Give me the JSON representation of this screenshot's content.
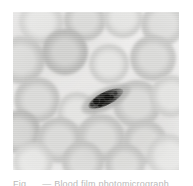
{
  "page": {
    "background_color": "#ffffff",
    "width": 193,
    "height": 186
  },
  "figure": {
    "name": "blood-smear-micrograph",
    "alt_description": "Grayscale light-microscopy image of a stained peripheral blood smear",
    "background_color": "#edeceb",
    "cell_fill_color": "#c2c2c0",
    "parasite_color": "#1e1e1c",
    "cells": [
      {
        "cx": 28,
        "cy": 10,
        "r": 22,
        "tone": "pale"
      },
      {
        "cx": 72,
        "cy": 8,
        "r": 21,
        "tone": "mid"
      },
      {
        "cx": 110,
        "cy": 6,
        "r": 20,
        "tone": "pale"
      },
      {
        "cx": 150,
        "cy": 12,
        "r": 22,
        "tone": "mid"
      },
      {
        "cx": 8,
        "cy": 48,
        "r": 24,
        "tone": "mid"
      },
      {
        "cx": 52,
        "cy": 40,
        "r": 23,
        "tone": "dark"
      },
      {
        "cx": 96,
        "cy": 52,
        "r": 20,
        "tone": "pale"
      },
      {
        "cx": 140,
        "cy": 46,
        "r": 23,
        "tone": "mid"
      },
      {
        "cx": 24,
        "cy": 88,
        "r": 23,
        "tone": "mid"
      },
      {
        "cx": 64,
        "cy": 100,
        "r": 20,
        "tone": "pale"
      },
      {
        "cx": 124,
        "cy": 92,
        "r": 24,
        "tone": "mid"
      },
      {
        "cx": 158,
        "cy": 84,
        "r": 21,
        "tone": "pale"
      },
      {
        "cx": 6,
        "cy": 120,
        "r": 22,
        "tone": "dark"
      },
      {
        "cx": 46,
        "cy": 128,
        "r": 23,
        "tone": "mid"
      },
      {
        "cx": 88,
        "cy": 126,
        "r": 24,
        "tone": "mid"
      },
      {
        "cx": 132,
        "cy": 130,
        "r": 22,
        "tone": "mid"
      },
      {
        "cx": 20,
        "cy": 150,
        "r": 20,
        "tone": "pale"
      },
      {
        "cx": 70,
        "cy": 150,
        "r": 21,
        "tone": "mid"
      },
      {
        "cx": 112,
        "cy": 152,
        "r": 20,
        "tone": "mid"
      },
      {
        "cx": 156,
        "cy": 144,
        "r": 22,
        "tone": "pale"
      }
    ],
    "parasite": {
      "name": "crescent-shaped-parasite",
      "shape": "elongated crescent (banana-shaped) form",
      "center_x": 93,
      "center_y": 87,
      "length": 54,
      "width": 18,
      "rotation_deg": -26,
      "chromatin_dots": [
        {
          "x": 14,
          "y": 12,
          "d": 6
        },
        {
          "x": 20,
          "y": 15,
          "d": 5
        },
        {
          "x": 26,
          "y": 13,
          "d": 6
        },
        {
          "x": 31,
          "y": 16,
          "d": 4
        },
        {
          "x": 17,
          "y": 18,
          "d": 4
        }
      ],
      "pigment_dots": [
        {
          "x": 10,
          "y": 14,
          "d": 4
        },
        {
          "x": 36,
          "y": 14,
          "d": 4
        },
        {
          "x": 23,
          "y": 10,
          "d": 3
        }
      ]
    }
  },
  "caption": {
    "text": "Fig. ... — Blood film photomicrograph",
    "color": "#b9b9b9",
    "clipped": true
  }
}
